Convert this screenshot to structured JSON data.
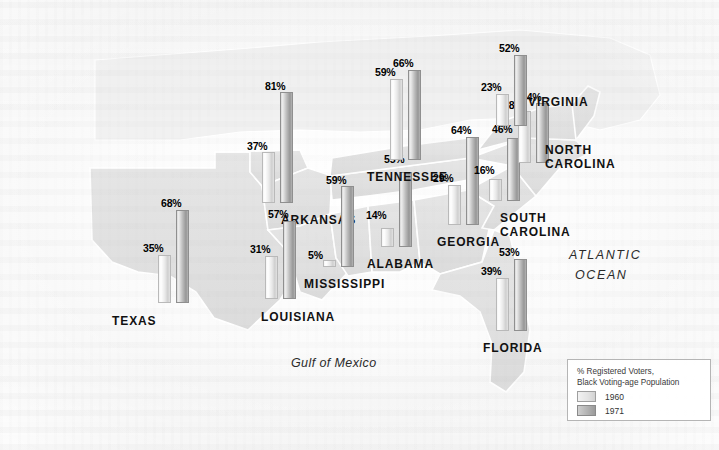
{
  "map": {
    "title": "Black voter registration in the South, 1960 vs 1971",
    "gulf_label": "Gulf of Mexico",
    "ocean_label_line1": "ATLANTIC",
    "ocean_label_line2": "OCEAN",
    "land_color": "#e0e0e0",
    "land_color_outside": "#f0f0f0",
    "border_color": "#ffffff",
    "bar_1960_color": "#e8e8e8",
    "bar_1971_color": "#b0b0b0"
  },
  "legend": {
    "title_line1": "% Registered Voters,",
    "title_line2": "Black Voting-age Population",
    "items": [
      {
        "year": "1960",
        "swatch": "light-gray"
      },
      {
        "year": "1971",
        "swatch": "dark-gray"
      }
    ]
  },
  "chart_data": {
    "type": "bar",
    "title": "% Registered Voters, Black Voting-age Population",
    "xlabel": "State",
    "ylabel": "% Registered Voters",
    "ylim": [
      0,
      100
    ],
    "grid": false,
    "legend_position": "bottom-right",
    "categories": [
      "Texas",
      "Arkansas",
      "Louisiana",
      "Mississippi",
      "Alabama",
      "Tennessee",
      "Georgia",
      "South Carolina",
      "North Carolina",
      "Virginia",
      "Florida"
    ],
    "series": [
      {
        "name": "1960",
        "values": [
          35,
          37,
          31,
          5,
          14,
          59,
          29,
          16,
          38,
          23,
          39
        ]
      },
      {
        "name": "1971",
        "values": [
          68,
          81,
          57,
          59,
          55,
          66,
          64,
          46,
          44,
          52,
          53
        ]
      }
    ]
  },
  "states": [
    {
      "name": "TEXAS",
      "label_x": 112,
      "label_y": 314,
      "bars": [
        {
          "year": "1960",
          "value": "35%",
          "x": 158,
          "bottom": 303,
          "height": 48,
          "label_x": 143,
          "label_y": 242
        },
        {
          "year": "1971",
          "value": "68%",
          "x": 176,
          "bottom": 303,
          "height": 93,
          "label_x": 161,
          "label_y": 197
        }
      ]
    },
    {
      "name": "ARKANSAS",
      "label_x": 281,
      "label_y": 213,
      "bars": [
        {
          "year": "1960",
          "value": "37%",
          "x": 262,
          "bottom": 203,
          "height": 51,
          "label_x": 247,
          "label_y": 140
        },
        {
          "year": "1971",
          "value": "81%",
          "x": 280,
          "bottom": 203,
          "height": 111,
          "label_x": 265,
          "label_y": 80
        }
      ]
    },
    {
      "name": "LOUISIANA",
      "label_x": 261,
      "label_y": 310,
      "bars": [
        {
          "year": "1960",
          "value": "31%",
          "x": 265,
          "bottom": 299,
          "height": 43,
          "label_x": 250,
          "label_y": 243
        },
        {
          "year": "1971",
          "value": "57%",
          "x": 283,
          "bottom": 299,
          "height": 78,
          "label_x": 268,
          "label_y": 208
        }
      ]
    },
    {
      "name": "MISSISSIPPI",
      "label_x": 304,
      "label_y": 277,
      "bars": [
        {
          "year": "1960",
          "value": "5%",
          "x": 323,
          "bottom": 267,
          "height": 7,
          "label_x": 308,
          "label_y": 249
        },
        {
          "year": "1971",
          "value": "59%",
          "x": 341,
          "bottom": 267,
          "height": 81,
          "label_x": 326,
          "label_y": 174
        }
      ]
    },
    {
      "name": "ALABAMA",
      "label_x": 367,
      "label_y": 257,
      "bars": [
        {
          "year": "1960",
          "value": "14%",
          "x": 381,
          "bottom": 247,
          "height": 19,
          "label_x": 366,
          "label_y": 209
        },
        {
          "year": "1971",
          "value": "55%",
          "x": 399,
          "bottom": 247,
          "height": 75,
          "label_x": 384,
          "label_y": 153
        }
      ]
    },
    {
      "name": "TENNESSEE",
      "label_x": 367,
      "label_y": 170,
      "bars": [
        {
          "year": "1960",
          "value": "59%",
          "x": 390,
          "bottom": 160,
          "height": 81,
          "label_x": 375,
          "label_y": 66
        },
        {
          "year": "1971",
          "value": "66%",
          "x": 408,
          "bottom": 160,
          "height": 90,
          "label_x": 393,
          "label_y": 57
        }
      ]
    },
    {
      "name": "GEORGIA",
      "label_x": 437,
      "label_y": 235,
      "bars": [
        {
          "year": "1960",
          "value": "29%",
          "x": 448,
          "bottom": 225,
          "height": 40,
          "label_x": 433,
          "label_y": 172
        },
        {
          "year": "1971",
          "value": "64%",
          "x": 466,
          "bottom": 225,
          "height": 88,
          "label_x": 451,
          "label_y": 124
        }
      ]
    },
    {
      "name": "SOUTH\nCAROLINA",
      "label_x": 500,
      "label_y": 211,
      "bars": [
        {
          "year": "1960",
          "value": "16%",
          "x": 489,
          "bottom": 201,
          "height": 22,
          "label_x": 474,
          "label_y": 164
        },
        {
          "year": "1971",
          "value": "46%",
          "x": 507,
          "bottom": 201,
          "height": 63,
          "label_x": 492,
          "label_y": 123
        }
      ]
    },
    {
      "name": "NORTH\nCAROLINA",
      "label_x": 545,
      "label_y": 143,
      "bars": [
        {
          "year": "1960",
          "value": "38%",
          "x": 518,
          "bottom": 163,
          "height": 52,
          "label_x": 503,
          "label_y": 99
        },
        {
          "year": "1971",
          "value": "44%",
          "x": 536,
          "bottom": 163,
          "height": 60,
          "label_x": 521,
          "label_y": 91
        }
      ]
    },
    {
      "name": "VIRGINIA",
      "label_x": 528,
      "label_y": 95,
      "bars": [
        {
          "year": "1960",
          "value": "23%",
          "x": 496,
          "bottom": 126,
          "height": 32,
          "label_x": 481,
          "label_y": 81
        },
        {
          "year": "1971",
          "value": "52%",
          "x": 514,
          "bottom": 126,
          "height": 71,
          "label_x": 499,
          "label_y": 42
        }
      ]
    },
    {
      "name": "FLORIDA",
      "label_x": 483,
      "label_y": 341,
      "bars": [
        {
          "year": "1960",
          "value": "39%",
          "x": 496,
          "bottom": 331,
          "height": 53,
          "label_x": 481,
          "label_y": 265
        },
        {
          "year": "1971",
          "value": "53%",
          "x": 514,
          "bottom": 331,
          "height": 72,
          "label_x": 499,
          "label_y": 246
        }
      ]
    }
  ]
}
